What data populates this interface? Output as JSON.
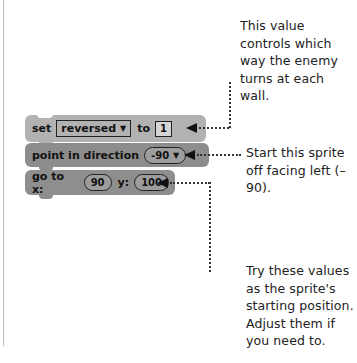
{
  "annotations": {
    "top": "This value controls which way the enemy turns at each wall.",
    "middle": "Start this sprite off facing left (–90).",
    "bottom": "Try these values as the sprite's starting position. Adjust them if you need to."
  },
  "blocks": [
    {
      "id": "set-variable",
      "parts": {
        "keyword": "set",
        "variable": "reversed",
        "dropdown_arrow": "▼",
        "to": "to",
        "value": "1"
      }
    },
    {
      "id": "point-in-direction",
      "parts": {
        "keyword": "point in direction",
        "value": "-90",
        "dropdown_arrow": "▼"
      }
    },
    {
      "id": "go-to-xy",
      "parts": {
        "keyword": "go to x:",
        "x": "90",
        "y_label": "y:",
        "y": "100"
      }
    }
  ],
  "colors": {
    "block_set": "#b2b2b2",
    "block_motion": "#8d8d8d",
    "text": "#222222"
  }
}
